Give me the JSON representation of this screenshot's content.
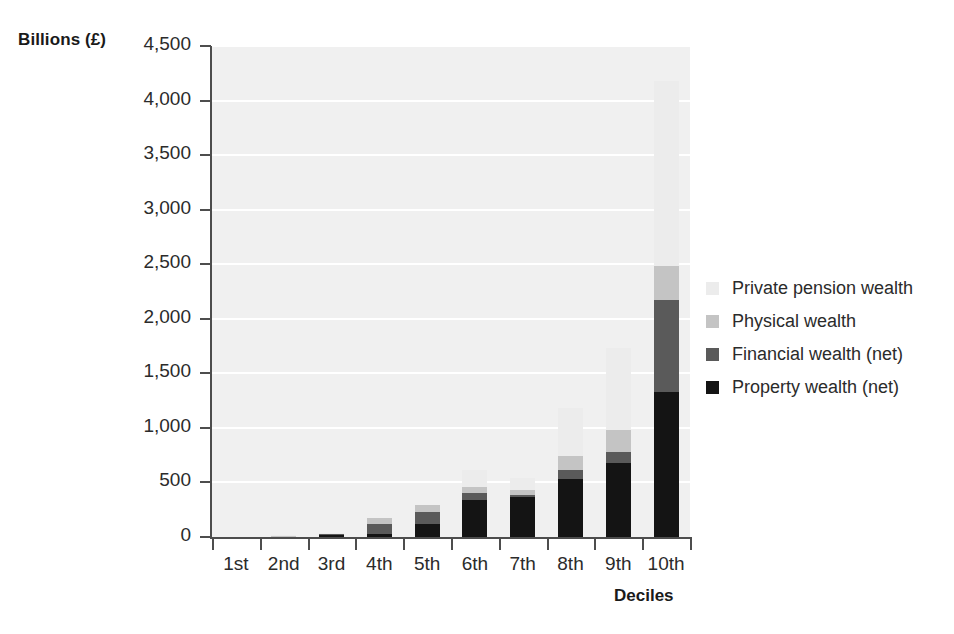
{
  "chart_data": {
    "type": "bar",
    "stacked": true,
    "title": "",
    "xlabel": "Deciles",
    "ylabel": "Billions (£)",
    "categories": [
      "1st",
      "2nd",
      "3rd",
      "4th",
      "5th",
      "6th",
      "7th",
      "8th",
      "9th",
      "10th"
    ],
    "ylim": [
      0,
      4500
    ],
    "yticks": [
      0,
      500,
      1000,
      1500,
      2000,
      2500,
      3000,
      3500,
      4000,
      4500
    ],
    "ytick_labels": [
      "0",
      "500",
      "1,000",
      "1,500",
      "2,000",
      "2,500",
      "3,000",
      "3,500",
      "4,000",
      "4,500"
    ],
    "grid": true,
    "legend_position": "right",
    "series": [
      {
        "name": "Property wealth (net)",
        "color": "#141414",
        "values": [
          0,
          5,
          15,
          25,
          120,
          340,
          370,
          530,
          680,
          1330
        ]
      },
      {
        "name": "Financial wealth (net)",
        "color": "#5a5a5a",
        "values": [
          0,
          3,
          10,
          95,
          110,
          65,
          15,
          85,
          100,
          845
        ]
      },
      {
        "name": "Physical wealth",
        "color": "#c4c4c4",
        "values": [
          0,
          4,
          10,
          55,
          60,
          55,
          45,
          125,
          200,
          305
        ]
      },
      {
        "name": "Private pension wealth",
        "color": "#ececec",
        "values": [
          0,
          3,
          5,
          0,
          0,
          155,
          110,
          440,
          755,
          1700
        ]
      }
    ],
    "totals": [
      0,
      15,
      40,
      175,
      290,
      615,
      540,
      1180,
      1735,
      4180
    ]
  },
  "legend": {
    "items": [
      {
        "label": "Private pension wealth",
        "color": "#ececec"
      },
      {
        "label": "Physical wealth",
        "color": "#c4c4c4"
      },
      {
        "label": "Financial wealth (net)",
        "color": "#5a5a5a"
      },
      {
        "label": "Property wealth (net)",
        "color": "#141414"
      }
    ]
  },
  "style": {
    "plot_background": "#f0f0f0",
    "gridline_color": "#ffffff",
    "axis_color": "#4d4d4d",
    "text_color": "#2b2b2b"
  }
}
